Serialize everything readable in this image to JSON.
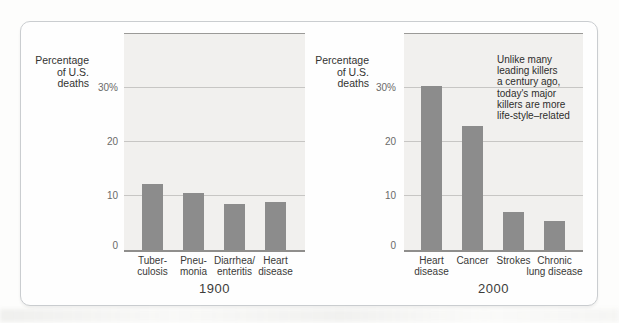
{
  "colors": {
    "panel_border": "#cacdd0",
    "panel_bg": "#fefefe",
    "plot_bg": "#f1f0ee",
    "plot_top_border": "#9b9a98",
    "axis": "#8f8e8c",
    "gridline": "#c7c6c4",
    "bar": "#8c8c8c",
    "label_text": "#333331",
    "tick_text": "#6b6a68"
  },
  "chart_data": [
    {
      "type": "bar",
      "title": "1900",
      "ylabel": "Percentage of U.S. deaths",
      "ylabel_lines": [
        "Percentage",
        "of U.S.",
        "deaths"
      ],
      "categories": [
        "Tuberculosis",
        "Pneumonia",
        "Diarrhea/enteritis",
        "Heart disease"
      ],
      "category_label_lines": [
        [
          "Tuber-",
          "culosis"
        ],
        [
          "Pneu-",
          "monia"
        ],
        [
          "Diarrhea/",
          "enteritis"
        ],
        [
          "Heart",
          "disease"
        ]
      ],
      "values": [
        12.3,
        10.5,
        8.5,
        8.8
      ],
      "ylim": [
        0,
        40
      ],
      "yticks": [
        {
          "value": 30,
          "label": "30%"
        },
        {
          "value": 20,
          "label": "20"
        },
        {
          "value": 10,
          "label": "10"
        },
        {
          "value": 0,
          "label": "0"
        }
      ],
      "grid": true,
      "legend_position": "none"
    },
    {
      "type": "bar",
      "title": "2000",
      "ylabel": "Percentage of U.S. deaths",
      "ylabel_lines": [
        "Percentage",
        "of U.S.",
        "deaths"
      ],
      "categories": [
        "Heart disease",
        "Cancer",
        "Strokes",
        "Chronic lung disease"
      ],
      "category_label_lines": [
        [
          "Heart",
          "disease"
        ],
        [
          "Cancer"
        ],
        [
          "Strokes"
        ],
        [
          "Chronic",
          "lung disease"
        ]
      ],
      "values": [
        30.3,
        23,
        7,
        5.3
      ],
      "ylim": [
        0,
        40
      ],
      "yticks": [
        {
          "value": 30,
          "label": "30%"
        },
        {
          "value": 20,
          "label": "20"
        },
        {
          "value": 10,
          "label": "10"
        },
        {
          "value": 0,
          "label": "0"
        }
      ],
      "grid": true,
      "legend_position": "none",
      "annotation": "Unlike many leading killers a century ago, today's major killers are more life-style–related",
      "annotation_lines": [
        "Unlike many",
        "leading killers",
        "a century ago,",
        "today's major",
        "killers are more",
        "life-style–related"
      ]
    }
  ]
}
